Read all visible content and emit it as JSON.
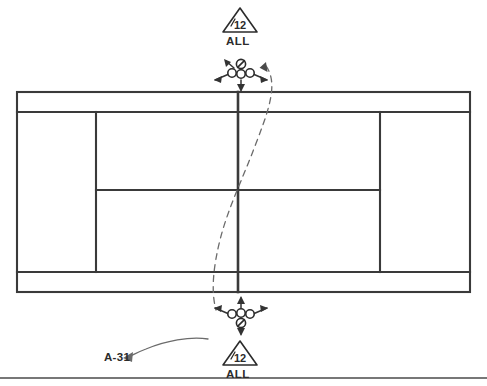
{
  "diagram": {
    "type": "tennis-court-drill",
    "title": "A-31",
    "court": {
      "orientation": "horizontal",
      "surface_color": "#ffffff",
      "line_color": "#3a3a3a",
      "outer_bounds": {
        "x1": 17,
        "y1": 92,
        "x2": 470,
        "y2": 292
      },
      "singles_bounds": {
        "x1": 17,
        "y1": 112,
        "x2": 470,
        "y2": 272
      },
      "net_line_x": 238,
      "service_line_left_x": 96,
      "service_line_right_x": 380,
      "center_service_line_y": 190,
      "alley_top_y": 112,
      "alley_bottom_y": 272
    },
    "footer_rule": {
      "y": 378,
      "color": "#4a4a4a"
    }
  },
  "markers": {
    "top_group": {
      "name": "player-group-far",
      "center_x": 240,
      "center_y": 73,
      "player_count": 4,
      "arrow_count": 4,
      "description": "cluster of player circles with radiating movement arrows"
    },
    "bottom_group": {
      "name": "player-group-near",
      "center_x": 240,
      "center_y": 316,
      "player_count": 4,
      "arrow_count": 4,
      "description": "cluster of player circles with radiating movement arrows"
    }
  },
  "trajectory": {
    "name": "ball-path",
    "style": "dashed",
    "color": "#6b6b6b",
    "description": "S-shaped dashed ball flight path between the two player groups"
  },
  "signs": {
    "top": {
      "number": "12",
      "label": "ALL",
      "shape": "triangle",
      "center_x": 240,
      "center_y": 22
    },
    "bottom": {
      "number": "12",
      "label": "ALL",
      "shape": "triangle",
      "center_x": 240,
      "center_y": 355
    }
  },
  "callout": {
    "label": "A-31",
    "x": 104,
    "y": 358,
    "arrow": {
      "name": "callout-arrow",
      "color": "#6b6b6b",
      "description": "curved arrow pointing left toward the A-31 label"
    }
  },
  "colors": {
    "court_line": "#3a3a3a",
    "text": "#2b2b2b",
    "dash": "#6b6b6b",
    "background": "#ffffff"
  }
}
